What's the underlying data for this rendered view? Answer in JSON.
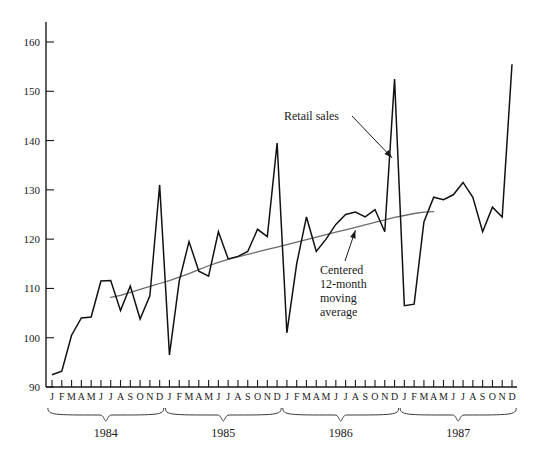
{
  "chart_data": {
    "type": "line",
    "title": "",
    "xlabel": "",
    "ylabel": "",
    "ylim": [
      90,
      165
    ],
    "yticks": [
      90,
      100,
      110,
      120,
      130,
      140,
      150,
      160
    ],
    "ytick_labels": [
      "90",
      "100",
      "110",
      "120",
      "130",
      "140",
      "150",
      "160"
    ],
    "grid": false,
    "legend_position": "none",
    "months": [
      "J",
      "F",
      "M",
      "A",
      "M",
      "J",
      "J",
      "A",
      "S",
      "O",
      "N",
      "D"
    ],
    "years": [
      "1984",
      "1985",
      "1986",
      "1987"
    ],
    "x": [
      "1984-01",
      "1984-02",
      "1984-03",
      "1984-04",
      "1984-05",
      "1984-06",
      "1984-07",
      "1984-08",
      "1984-09",
      "1984-10",
      "1984-11",
      "1984-12",
      "1985-01",
      "1985-02",
      "1985-03",
      "1985-04",
      "1985-05",
      "1985-06",
      "1985-07",
      "1985-08",
      "1985-09",
      "1985-10",
      "1985-11",
      "1985-12",
      "1986-01",
      "1986-02",
      "1986-03",
      "1986-04",
      "1986-05",
      "1986-06",
      "1986-07",
      "1986-08",
      "1986-09",
      "1986-10",
      "1986-11",
      "1986-12",
      "1987-01",
      "1987-02",
      "1987-03",
      "1987-04",
      "1987-05",
      "1987-06",
      "1987-07",
      "1987-08",
      "1987-09",
      "1987-10",
      "1987-11",
      "1987-12"
    ],
    "series": [
      {
        "name": "Retail sales",
        "color": "#111111",
        "values": [
          92.5,
          93.2,
          100.5,
          104.0,
          104.2,
          111.5,
          111.6,
          105.5,
          110.5,
          103.8,
          108.5,
          131.0,
          96.5,
          111.5,
          119.5,
          113.5,
          112.5,
          121.5,
          116.0,
          116.5,
          117.5,
          122.0,
          120.5,
          139.5,
          101.0,
          115.0,
          124.5,
          117.5,
          120.0,
          123.0,
          125.0,
          125.5,
          124.5,
          126.0,
          121.5,
          152.5,
          106.5,
          106.8,
          123.5,
          128.5,
          128.0,
          129.0,
          131.5,
          128.5,
          121.5,
          126.5,
          124.5,
          155.5
        ]
      },
      {
        "name": "Centered 12-month moving average",
        "color": "#6b6b6b",
        "values": [
          null,
          null,
          null,
          null,
          null,
          null,
          108.2,
          108.6,
          109.2,
          109.8,
          110.4,
          111.0,
          111.6,
          112.3,
          113.0,
          113.8,
          114.6,
          115.3,
          115.9,
          116.4,
          116.9,
          117.4,
          117.9,
          118.4,
          118.9,
          119.4,
          119.9,
          120.4,
          120.9,
          121.4,
          121.9,
          122.4,
          122.9,
          123.4,
          123.9,
          124.4,
          124.8,
          125.2,
          125.5,
          125.6,
          null,
          null,
          null,
          null,
          null,
          null,
          null,
          null
        ]
      }
    ],
    "annotations": [
      {
        "id": "retail-sales",
        "text": "Retail sales",
        "target_point": "1986-12",
        "target_value": 152.5
      },
      {
        "id": "moving-average",
        "lines": [
          "Centered",
          "12-month",
          "moving",
          "average"
        ],
        "text": "Centered 12-month moving average",
        "target_point": "1986-08",
        "target_value": 122.4
      }
    ]
  }
}
